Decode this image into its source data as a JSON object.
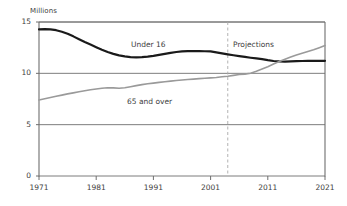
{
  "chart_data": {
    "type": "line",
    "title": "",
    "subtitle": "",
    "xlabel": "",
    "ylabel": "Millions",
    "unit_label": "Millions",
    "xlim": [
      1971,
      2021
    ],
    "ylim": [
      0,
      15
    ],
    "xticks": [
      1971,
      1981,
      1991,
      2001,
      2011,
      2021
    ],
    "yticks": [
      0,
      5,
      10,
      15
    ],
    "grid": "horizontal",
    "legend_position": "inline-annotations",
    "annotations": [
      {
        "text": "Under 16",
        "x": 1992,
        "y": 12.9
      },
      {
        "text": "65 and over",
        "x": 1991,
        "y": 8.0
      },
      {
        "text": "Projections",
        "x": 2006,
        "y": 12.9
      }
    ],
    "projection_divider": {
      "x": 2004,
      "style": "dashed",
      "color": "#aaaaaa"
    },
    "x": [
      1971,
      1972,
      1973,
      1974,
      1975,
      1976,
      1977,
      1978,
      1979,
      1980,
      1981,
      1982,
      1983,
      1984,
      1985,
      1986,
      1987,
      1988,
      1989,
      1990,
      1991,
      1992,
      1993,
      1994,
      1995,
      1996,
      1997,
      1998,
      1999,
      2000,
      2001,
      2002,
      2003,
      2004,
      2005,
      2006,
      2007,
      2008,
      2009,
      2010,
      2011,
      2012,
      2013,
      2014,
      2015,
      2016,
      2017,
      2018,
      2019,
      2020,
      2021
    ],
    "series": [
      {
        "name": "Under 16",
        "color": "#1a1a1a",
        "width": 2.2,
        "values": [
          14.28,
          14.3,
          14.28,
          14.2,
          14.05,
          13.85,
          13.6,
          13.32,
          13.05,
          12.8,
          12.55,
          12.3,
          12.08,
          11.9,
          11.75,
          11.65,
          11.58,
          11.56,
          11.58,
          11.63,
          11.7,
          11.8,
          11.9,
          12.0,
          12.08,
          12.13,
          12.16,
          12.17,
          12.16,
          12.15,
          12.14,
          12.05,
          11.95,
          11.85,
          11.76,
          11.68,
          11.6,
          11.52,
          11.45,
          11.38,
          11.28,
          11.2,
          11.16,
          11.15,
          11.16,
          11.18,
          11.2,
          11.21,
          11.21,
          11.21,
          11.22
        ]
      },
      {
        "name": "65 and over",
        "color": "#9a9a9a",
        "width": 1.6,
        "values": [
          7.4,
          7.52,
          7.64,
          7.76,
          7.88,
          8.0,
          8.1,
          8.2,
          8.3,
          8.4,
          8.48,
          8.55,
          8.6,
          8.58,
          8.55,
          8.6,
          8.7,
          8.8,
          8.9,
          8.98,
          9.05,
          9.12,
          9.18,
          9.24,
          9.3,
          9.35,
          9.4,
          9.44,
          9.48,
          9.52,
          9.56,
          9.6,
          9.66,
          9.72,
          9.8,
          9.88,
          9.92,
          10.0,
          10.2,
          10.42,
          10.65,
          10.9,
          11.15,
          11.38,
          11.58,
          11.78,
          11.95,
          12.12,
          12.3,
          12.5,
          12.7
        ]
      }
    ]
  },
  "axis": {
    "ytick_labels": [
      "0",
      "5",
      "10",
      "15"
    ],
    "xtick_labels": [
      "1971",
      "1981",
      "1991",
      "2001",
      "2011",
      "2021"
    ]
  },
  "colors": {
    "under16": "#1a1a1a",
    "over65": "#9a9a9a",
    "gridline": "#6e6e6e",
    "axis": "#6e6e6e",
    "divider": "#aaaaaa",
    "text": "#3d3d3d",
    "background": "#ffffff"
  }
}
